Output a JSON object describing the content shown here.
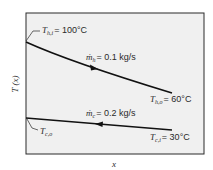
{
  "diagram": {
    "type": "temperature-distribution",
    "axes": {
      "xlabel": "x",
      "ylabel": "T (x)"
    },
    "hot_stream": {
      "inlet_label_symbol": "T",
      "inlet_label_sub": "h,i",
      "inlet_value": "= 100°C",
      "outlet_label_symbol": "T",
      "outlet_label_sub": "h,o",
      "outlet_value": "= 60°C",
      "flow_symbol": "ṁ",
      "flow_sub": "h",
      "flow_value": "= 0.1 kg/s",
      "direction": "left-to-right"
    },
    "cold_stream": {
      "inlet_label_symbol": "T",
      "inlet_label_sub": "c,i",
      "inlet_value": "= 30°C",
      "outlet_label_symbol": "T",
      "outlet_label_sub": "c,o",
      "outlet_value": "",
      "flow_symbol": "ṁ",
      "flow_sub": "c",
      "flow_value": "= 0.2 kg/s",
      "direction": "right-to-left"
    },
    "colors": {
      "background": "#f0f0f0",
      "frame": "#2a2a2a",
      "line": "#111111"
    }
  }
}
